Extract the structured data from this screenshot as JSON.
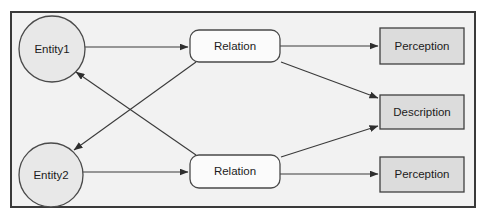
{
  "diagram": {
    "frame": {
      "name": "outer-frame",
      "x": 11,
      "y": 12,
      "width": 464,
      "height": 195,
      "fill": "#f2f2f2",
      "stroke": "#3a3a3a"
    },
    "nodes": [
      {
        "id": "entity1",
        "label": "Entity1",
        "shape": "circle",
        "cx": 52,
        "cy": 49,
        "r": 33,
        "fill": "#e8e8e8",
        "stroke": "#4a4a4a"
      },
      {
        "id": "entity2",
        "label": "Entity2",
        "shape": "circle",
        "cx": 51,
        "cy": 175,
        "r": 32,
        "fill": "#e8e8e8",
        "stroke": "#4a4a4a"
      },
      {
        "id": "relation1",
        "label": "Relation",
        "shape": "rounded-rect",
        "x": 190,
        "y": 30,
        "width": 90,
        "height": 32,
        "rx": 9,
        "fill": "#fbfbfb",
        "stroke": "#4a4a4a"
      },
      {
        "id": "relation2",
        "label": "Relation",
        "shape": "rounded-rect",
        "x": 190,
        "y": 155,
        "width": 90,
        "height": 33,
        "rx": 9,
        "fill": "#fbfbfb",
        "stroke": "#4a4a4a"
      },
      {
        "id": "perception-top",
        "label": "Perception",
        "shape": "rect",
        "x": 380,
        "y": 28,
        "width": 84,
        "height": 36,
        "fill": "#dcdcdc",
        "stroke": "#3f3f3f"
      },
      {
        "id": "description",
        "label": "Description",
        "shape": "rect",
        "x": 380,
        "y": 95,
        "width": 84,
        "height": 34,
        "fill": "#dcdcdc",
        "stroke": "#3f3f3f"
      },
      {
        "id": "perception-bottom",
        "label": "Perception",
        "shape": "rect",
        "x": 380,
        "y": 157,
        "width": 84,
        "height": 35,
        "fill": "#dcdcdc",
        "stroke": "#3f3f3f"
      }
    ],
    "edges": [
      {
        "id": "entity1-to-relation1",
        "from": "entity1",
        "to": "relation1",
        "x1": 85,
        "y1": 47,
        "x2": 188,
        "y2": 47,
        "arrow": true
      },
      {
        "id": "entity2-to-relation2",
        "from": "entity2",
        "to": "relation2",
        "x1": 83,
        "y1": 172,
        "x2": 188,
        "y2": 172,
        "arrow": true
      },
      {
        "id": "relation1-to-perception-top",
        "from": "relation1",
        "to": "perception-top",
        "x1": 280,
        "y1": 46,
        "x2": 378,
        "y2": 46,
        "arrow": true
      },
      {
        "id": "relation1-to-description",
        "from": "relation1",
        "to": "description",
        "x1": 281,
        "y1": 62,
        "x2": 378,
        "y2": 98,
        "arrow": true
      },
      {
        "id": "relation2-to-description",
        "from": "relation2",
        "to": "description",
        "x1": 281,
        "y1": 157,
        "x2": 378,
        "y2": 126,
        "arrow": true
      },
      {
        "id": "relation2-to-perception-bottom",
        "from": "relation2",
        "to": "perception-bottom",
        "x1": 280,
        "y1": 174,
        "x2": 378,
        "y2": 174,
        "arrow": true
      },
      {
        "id": "relation1-to-entity2",
        "from": "relation1",
        "to": "entity2",
        "x1": 196,
        "y1": 62,
        "x2": 74,
        "y2": 150,
        "arrow": true
      },
      {
        "id": "relation2-to-entity1",
        "from": "relation2",
        "to": "entity1",
        "x1": 196,
        "y1": 155,
        "x2": 76,
        "y2": 72,
        "arrow": true
      }
    ]
  }
}
